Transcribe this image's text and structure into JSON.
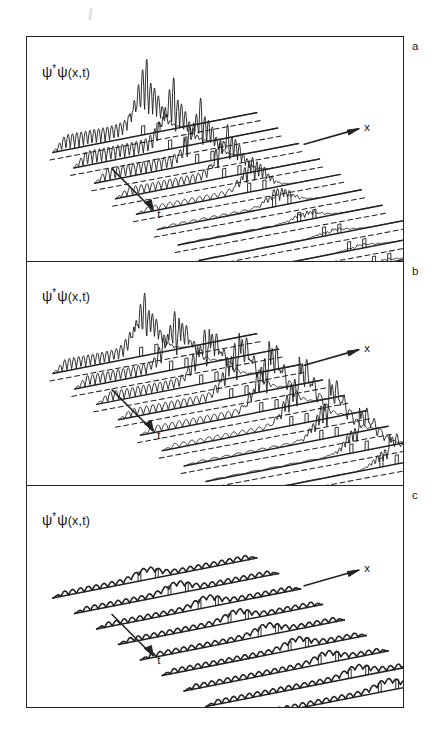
{
  "figure": {
    "title_label": "",
    "background_color": "#ffffff",
    "ink_color": "#232323",
    "panels": [
      {
        "id": "a",
        "letter": "a",
        "ylabel_psi": "ψ",
        "ylabel_star": "*",
        "ylabel_psi2": "ψ",
        "ylabel_args": "(x,t)",
        "x_axis_label": "x",
        "t_axis_label": "t"
      },
      {
        "id": "b",
        "letter": "b",
        "ylabel_psi": "ψ",
        "ylabel_star": "*",
        "ylabel_psi2": "ψ",
        "ylabel_args": "(x,t)",
        "x_axis_label": "x",
        "t_axis_label": "t"
      },
      {
        "id": "c",
        "letter": "c",
        "ylabel_psi": "ψ",
        "ylabel_star": "*",
        "ylabel_psi2": "ψ",
        "ylabel_args": "(x,t)",
        "x_axis_label": "x",
        "t_axis_label": "t"
      }
    ]
  },
  "chart_data": {
    "type": "line",
    "plot_style": "stacked waterfall of successive time slices, each slice drawn on an oblique baseline",
    "xlabel": "x",
    "ylabel": "ψ*ψ(x,t)",
    "zlabel": "t",
    "legend": [],
    "grid": false,
    "panels": [
      {
        "id": "a",
        "letter": "a",
        "caption": "",
        "n_traces": 10,
        "trace_labels": [
          "t1",
          "t2",
          "t3",
          "t4",
          "t5",
          "t6",
          "t7",
          "t8",
          "t9",
          "t10"
        ],
        "baseline_style": "solid",
        "guide_line_style": "dashed",
        "barrier_marks_per_trace": 2,
        "description": "Incident oscillatory wave train approaches from the left, builds strong interference spikes at the barrier, and only a very small remnant passes; later traces are nearly flat with two small square barrier steps.",
        "traces": [
          {
            "t_index": 1,
            "incident_amplitude": 0.55,
            "peak_amplitude": 1.0,
            "transmitted_amplitude": 0.04,
            "n_ripples": 22,
            "packet_center_x": 0.47
          },
          {
            "t_index": 2,
            "incident_amplitude": 0.52,
            "peak_amplitude": 0.95,
            "transmitted_amplitude": 0.05,
            "n_ripples": 22,
            "packet_center_x": 0.5
          },
          {
            "t_index": 3,
            "incident_amplitude": 0.45,
            "peak_amplitude": 0.9,
            "transmitted_amplitude": 0.06,
            "n_ripples": 21,
            "packet_center_x": 0.53
          },
          {
            "t_index": 4,
            "incident_amplitude": 0.33,
            "peak_amplitude": 0.78,
            "transmitted_amplitude": 0.07,
            "n_ripples": 20,
            "packet_center_x": 0.56
          },
          {
            "t_index": 5,
            "incident_amplitude": 0.2,
            "peak_amplitude": 0.55,
            "transmitted_amplitude": 0.07,
            "n_ripples": 16,
            "packet_center_x": 0.58
          },
          {
            "t_index": 6,
            "incident_amplitude": 0.1,
            "peak_amplitude": 0.3,
            "transmitted_amplitude": 0.07,
            "n_ripples": 12,
            "packet_center_x": 0.6
          },
          {
            "t_index": 7,
            "incident_amplitude": 0.04,
            "peak_amplitude": 0.14,
            "transmitted_amplitude": 0.06,
            "n_ripples": 8,
            "packet_center_x": 0.62
          },
          {
            "t_index": 8,
            "incident_amplitude": 0.02,
            "peak_amplitude": 0.07,
            "transmitted_amplitude": 0.06,
            "n_ripples": 5,
            "packet_center_x": 0.64
          },
          {
            "t_index": 9,
            "incident_amplitude": 0.0,
            "peak_amplitude": 0.05,
            "transmitted_amplitude": 0.05,
            "n_ripples": 0,
            "packet_center_x": 0.66
          },
          {
            "t_index": 10,
            "incident_amplitude": 0.0,
            "peak_amplitude": 0.05,
            "transmitted_amplitude": 0.05,
            "n_ripples": 0,
            "packet_center_x": 0.68
          }
        ]
      },
      {
        "id": "b",
        "letter": "b",
        "caption": "",
        "n_traces": 9,
        "trace_labels": [
          "t1",
          "t2",
          "t3",
          "t4",
          "t5",
          "t6",
          "t7",
          "t8",
          "t9"
        ],
        "baseline_style": "solid",
        "guide_line_style": "dashed",
        "barrier_marks_per_trace": 2,
        "description": "Incident wave train with strong interference at the barrier; a substantial transmitted packet emerges and propagates to the right in later traces.",
        "traces": [
          {
            "t_index": 1,
            "incident_amplitude": 0.45,
            "peak_amplitude": 0.9,
            "transmitted_amplitude": 0.1,
            "n_ripples": 20,
            "packet_center_x": 0.46
          },
          {
            "t_index": 2,
            "incident_amplitude": 0.42,
            "peak_amplitude": 0.85,
            "transmitted_amplitude": 0.3,
            "n_ripples": 20,
            "packet_center_x": 0.5
          },
          {
            "t_index": 3,
            "incident_amplitude": 0.38,
            "peak_amplitude": 0.8,
            "transmitted_amplitude": 0.45,
            "n_ripples": 20,
            "packet_center_x": 0.54
          },
          {
            "t_index": 4,
            "incident_amplitude": 0.32,
            "peak_amplitude": 0.88,
            "transmitted_amplitude": 0.6,
            "n_ripples": 19,
            "packet_center_x": 0.58
          },
          {
            "t_index": 5,
            "incident_amplitude": 0.26,
            "peak_amplitude": 0.92,
            "transmitted_amplitude": 0.7,
            "n_ripples": 18,
            "packet_center_x": 0.62
          },
          {
            "t_index": 6,
            "incident_amplitude": 0.18,
            "peak_amplitude": 0.85,
            "transmitted_amplitude": 0.75,
            "n_ripples": 16,
            "packet_center_x": 0.66
          },
          {
            "t_index": 7,
            "incident_amplitude": 0.1,
            "peak_amplitude": 0.7,
            "transmitted_amplitude": 0.7,
            "n_ripples": 12,
            "packet_center_x": 0.7
          },
          {
            "t_index": 8,
            "incident_amplitude": 0.05,
            "peak_amplitude": 0.5,
            "transmitted_amplitude": 0.55,
            "n_ripples": 8,
            "packet_center_x": 0.74
          },
          {
            "t_index": 9,
            "incident_amplitude": 0.02,
            "peak_amplitude": 0.35,
            "transmitted_amplitude": 0.4,
            "n_ripples": 5,
            "packet_center_x": 0.78
          }
        ]
      },
      {
        "id": "c",
        "letter": "c",
        "caption": "",
        "n_traces": 9,
        "trace_labels": [
          "t1",
          "t2",
          "t3",
          "t4",
          "t5",
          "t6",
          "t7",
          "t8",
          "t9"
        ],
        "baseline_style": "solid",
        "guide_line_style": "none",
        "barrier_marks_per_trace": 2,
        "description": "Dense small-amplitude ripples along the whole line with a single broad low bump drifting steadily to the right; two narrow barrier markers per trace.",
        "traces": [
          {
            "t_index": 1,
            "incident_amplitude": 0.1,
            "peak_amplitude": 0.18,
            "transmitted_amplitude": 0.1,
            "n_ripples": 26,
            "packet_center_x": 0.46
          },
          {
            "t_index": 2,
            "incident_amplitude": 0.1,
            "peak_amplitude": 0.18,
            "transmitted_amplitude": 0.1,
            "n_ripples": 26,
            "packet_center_x": 0.5
          },
          {
            "t_index": 3,
            "incident_amplitude": 0.1,
            "peak_amplitude": 0.18,
            "transmitted_amplitude": 0.1,
            "n_ripples": 26,
            "packet_center_x": 0.54
          },
          {
            "t_index": 4,
            "incident_amplitude": 0.1,
            "peak_amplitude": 0.18,
            "transmitted_amplitude": 0.1,
            "n_ripples": 26,
            "packet_center_x": 0.58
          },
          {
            "t_index": 5,
            "incident_amplitude": 0.1,
            "peak_amplitude": 0.18,
            "transmitted_amplitude": 0.1,
            "n_ripples": 26,
            "packet_center_x": 0.62
          },
          {
            "t_index": 6,
            "incident_amplitude": 0.1,
            "peak_amplitude": 0.18,
            "transmitted_amplitude": 0.1,
            "n_ripples": 26,
            "packet_center_x": 0.66
          },
          {
            "t_index": 7,
            "incident_amplitude": 0.1,
            "peak_amplitude": 0.18,
            "transmitted_amplitude": 0.1,
            "n_ripples": 26,
            "packet_center_x": 0.7
          },
          {
            "t_index": 8,
            "incident_amplitude": 0.1,
            "peak_amplitude": 0.18,
            "transmitted_amplitude": 0.1,
            "n_ripples": 26,
            "packet_center_x": 0.74
          },
          {
            "t_index": 9,
            "incident_amplitude": 0.1,
            "peak_amplitude": 0.18,
            "transmitted_amplitude": 0.1,
            "n_ripples": 26,
            "packet_center_x": 0.78
          }
        ]
      }
    ]
  }
}
